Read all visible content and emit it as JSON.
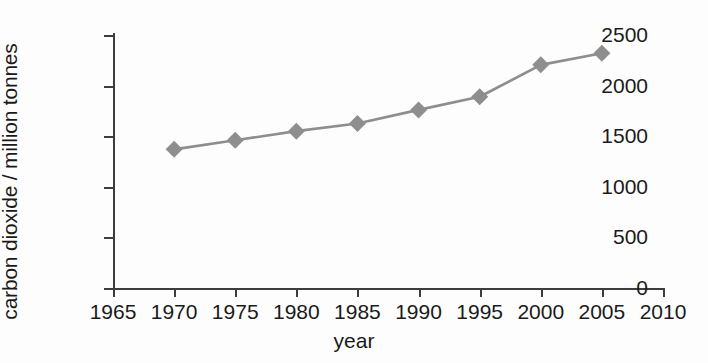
{
  "chart_data": {
    "type": "line",
    "title": "",
    "xlabel": "year",
    "ylabel": "carbon dioxide / million tonnes",
    "x": [
      1970,
      1975,
      1980,
      1985,
      1990,
      1995,
      2000,
      2005
    ],
    "values": [
      1370,
      1460,
      1550,
      1625,
      1760,
      1890,
      2205,
      2320
    ],
    "series": [
      {
        "name": "carbon dioxide",
        "x": [
          1970,
          1975,
          1980,
          1985,
          1990,
          1995,
          2000,
          2005
        ],
        "values": [
          1370,
          1460,
          1550,
          1625,
          1760,
          1890,
          2205,
          2320
        ]
      }
    ],
    "xlim": [
      1965,
      2010
    ],
    "ylim": [
      0,
      2500
    ],
    "xticks": [
      1965,
      1970,
      1975,
      1980,
      1985,
      1990,
      1995,
      2000,
      2005,
      2010
    ],
    "yticks": [
      0,
      500,
      1000,
      1500,
      2000,
      2500
    ],
    "xtick_labels": [
      "1965",
      "1970",
      "1975",
      "1980",
      "1985",
      "1990",
      "1995",
      "2000",
      "2005",
      "2010"
    ],
    "ytick_labels": [
      "0",
      "500",
      "1000",
      "1500",
      "2000",
      "2500"
    ],
    "grid": false,
    "legend": false,
    "marker": "diamond",
    "colors": {
      "line": "#8e8e8e",
      "marker": "#8e8e8e",
      "axis": "#3d3d3d",
      "text": "#1a1a1a",
      "background": "#fdfdfd"
    }
  }
}
